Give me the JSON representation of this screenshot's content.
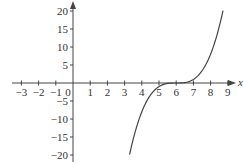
{
  "chart_data": {
    "type": "line",
    "title": "",
    "xlabel": "x",
    "ylabel": "",
    "function": "y = (x - 6)^3",
    "xlim": [
      -3.6,
      9.6
    ],
    "ylim": [
      -22,
      22
    ],
    "grid": false,
    "legend": null,
    "x_ticks": [
      -3,
      -2,
      -1,
      0,
      1,
      2,
      3,
      4,
      5,
      6,
      7,
      8,
      9
    ],
    "x_tick_labels": [
      "−3",
      "−2",
      "−1",
      "0",
      "1",
      "2",
      "3",
      "4",
      "5",
      "6",
      "7",
      "8",
      "9"
    ],
    "y_ticks": [
      20,
      15,
      10,
      5,
      -5,
      -10,
      -15,
      -20
    ],
    "y_tick_labels": [
      "20",
      "15",
      "10",
      "5",
      "−5",
      "−10",
      "−15",
      "−20"
    ],
    "series": [
      {
        "name": "curve",
        "x_range": [
          3.29,
          8.72
        ],
        "x": [
          3.29,
          3.5,
          4.0,
          4.5,
          5.0,
          5.5,
          6.0,
          6.5,
          7.0,
          7.5,
          8.0,
          8.5,
          8.72
        ],
        "y": [
          -19.9,
          -15.6,
          -8.0,
          -3.4,
          -1.0,
          -0.1,
          0,
          0.1,
          1.0,
          3.4,
          8.0,
          15.6,
          20.1
        ]
      }
    ]
  },
  "colors": {
    "axis": "#444444",
    "curve": "#444444",
    "text": "#333333",
    "background": "#ffffff"
  }
}
